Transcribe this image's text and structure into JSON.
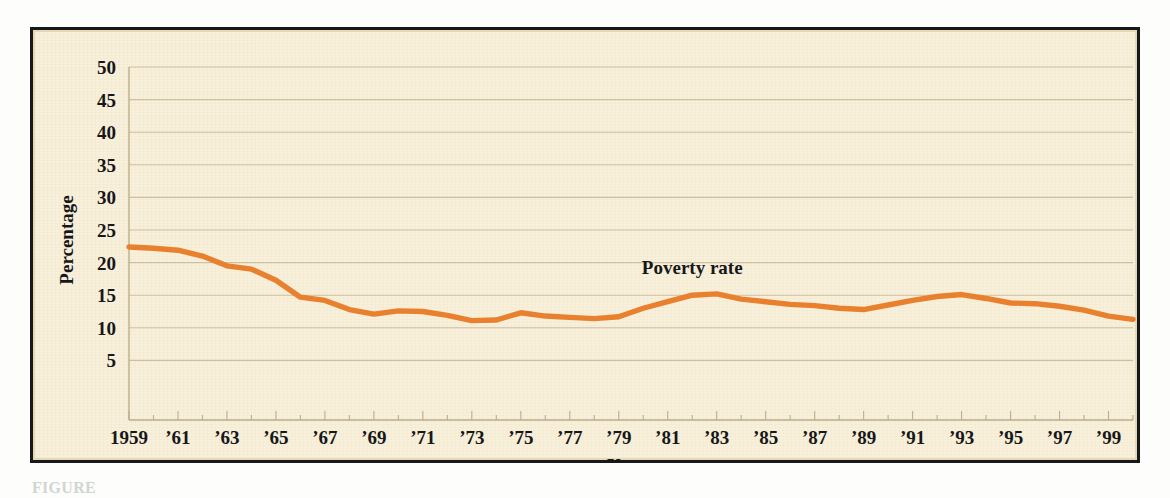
{
  "figure": {
    "caption_fragment": "FIGURE",
    "background_color": "#f8f0da",
    "frame_color": "#16181c"
  },
  "chart_data": {
    "type": "line",
    "title": "",
    "xlabel": "Year",
    "ylabel": "Percentage",
    "ylim": [
      0,
      50
    ],
    "ytick_values": [
      5,
      10,
      15,
      20,
      25,
      30,
      35,
      40,
      45,
      50
    ],
    "ytick_labels": [
      "5",
      "10",
      "15",
      "20",
      "25",
      "30",
      "35",
      "40",
      "45",
      "50"
    ],
    "xlim": [
      1959,
      2000
    ],
    "xtick_labels": [
      "1959",
      "’61",
      "’63",
      "’65",
      "’67",
      "’69",
      "’71",
      "’73",
      "’75",
      "’77",
      "’79",
      "’81",
      "’83",
      "’85",
      "’87",
      "’89",
      "’91",
      "’93",
      "’95",
      "’97",
      "’99"
    ],
    "xtick_years": [
      1959,
      1961,
      1963,
      1965,
      1967,
      1969,
      1971,
      1973,
      1975,
      1977,
      1979,
      1981,
      1983,
      1985,
      1987,
      1989,
      1991,
      1993,
      1995,
      1997,
      1999
    ],
    "grid": "horizontal",
    "legend_position": "inline-annotation",
    "series": [
      {
        "name": "Poverty rate",
        "color": "#e8802e",
        "annotation_label": "Poverty rate",
        "annotation_year": 1982,
        "annotation_value": 18.2,
        "x": [
          1959,
          1960,
          1961,
          1962,
          1963,
          1964,
          1965,
          1966,
          1967,
          1968,
          1969,
          1970,
          1971,
          1972,
          1973,
          1974,
          1975,
          1976,
          1977,
          1978,
          1979,
          1980,
          1981,
          1982,
          1983,
          1984,
          1985,
          1986,
          1987,
          1988,
          1989,
          1990,
          1991,
          1992,
          1993,
          1994,
          1995,
          1996,
          1997,
          1998,
          1999,
          2000
        ],
        "values": [
          22.4,
          22.2,
          21.9,
          21.0,
          19.5,
          19.0,
          17.3,
          14.7,
          14.2,
          12.8,
          12.1,
          12.6,
          12.5,
          11.9,
          11.1,
          11.2,
          12.3,
          11.8,
          11.6,
          11.4,
          11.7,
          13.0,
          14.0,
          15.0,
          15.2,
          14.4,
          14.0,
          13.6,
          13.4,
          13.0,
          12.8,
          13.5,
          14.2,
          14.8,
          15.1,
          14.5,
          13.8,
          13.7,
          13.3,
          12.7,
          11.8,
          11.3
        ]
      }
    ]
  }
}
